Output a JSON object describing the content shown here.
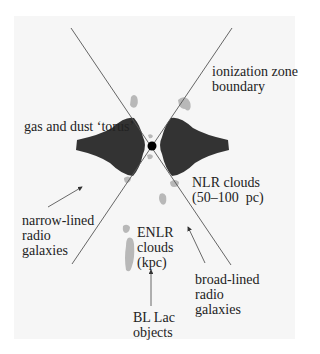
{
  "diagram": {
    "type": "AGN unified model schematic",
    "labels": {
      "ionization": "ionization zone\nboundary",
      "torus": "gas and dust ‘torus’",
      "nlr": "NLR clouds\n(50–100  pc)",
      "narrow": "narrow-lined\nradio\ngalaxies",
      "enlr": "ENLR\nclouds\n(kpc)",
      "broad": "broad-lined\nradio\ngalaxies",
      "bllac": "BL Lac\nobjects"
    },
    "colors": {
      "background": "#ffffff",
      "panel": "#f6f6f6",
      "torus": "#333333",
      "clouds": "#b8b8b8",
      "lines": "#555555",
      "nucleus": "#000000"
    }
  }
}
